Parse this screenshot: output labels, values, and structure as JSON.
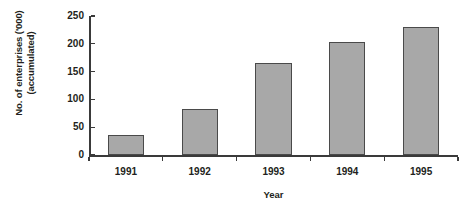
{
  "chart_data": {
    "type": "bar",
    "title": "",
    "subtitle": "",
    "categories": [
      "1991",
      "1992",
      "1993",
      "1994",
      "1995"
    ],
    "values": [
      36,
      83,
      165,
      203,
      230
    ],
    "xlabel": "Year",
    "ylabel_line1": "No. of enterprises ('000)",
    "ylabel_line2": "(accumulated)",
    "ylabel": "No. of enterprises ('000) (accumulated)",
    "ylim": [
      0,
      250
    ],
    "ytick_labels": [
      "0",
      "50",
      "100",
      "150",
      "200",
      "250"
    ],
    "ytick_values": [
      0,
      50,
      100,
      150,
      200,
      250
    ],
    "grid": false,
    "legend": false,
    "legend_position": "none",
    "series": [
      {
        "name": "No. of enterprises (accumulated)",
        "values": [
          36,
          83,
          165,
          203,
          230
        ]
      }
    ],
    "colors": {
      "bar_fill": "#a8a8a8",
      "bar_border": "#4a4a4a",
      "axis": "#3a3a3a",
      "text": "#231f20",
      "background": "#ffffff"
    }
  }
}
